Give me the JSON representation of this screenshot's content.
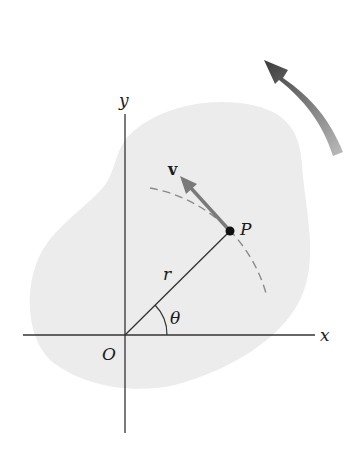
{
  "figure": {
    "labels": {
      "x_axis": "x",
      "y_axis": "y",
      "origin": "O",
      "point": "P",
      "radius": "r",
      "angle": "θ",
      "velocity": "v"
    },
    "colors": {
      "body_fill": "#ececec",
      "axes": "#333333",
      "radius_line": "#333333",
      "velocity_arrow": "#7a7a7a",
      "dashed_path": "#8a8a8a",
      "rotation_arrow_dark": "#3c3c3c",
      "rotation_arrow_light": "#b5b5b5",
      "point": "#111111"
    },
    "geometry": {
      "origin": [
        125,
        335
      ],
      "point_P": [
        230,
        231
      ],
      "velocity_tip": [
        180,
        176
      ],
      "theta_arc_radius": 42,
      "rotation_direction": "counterclockwise"
    }
  }
}
